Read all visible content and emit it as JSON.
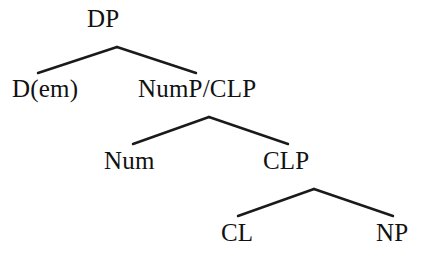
{
  "diagram": {
    "type": "syntax-tree",
    "background_color": "#ffffff",
    "line_color": "#1a1a1a",
    "text_color": "#111111",
    "nodes": [
      {
        "id": "dp",
        "label": "DP",
        "level": 0
      },
      {
        "id": "dem",
        "label": "D(em)",
        "level": 1
      },
      {
        "id": "nump_clp",
        "label": "NumP/CLP",
        "level": 1
      },
      {
        "id": "num",
        "label": "Num",
        "level": 2
      },
      {
        "id": "clp",
        "label": "CLP",
        "level": 2
      },
      {
        "id": "cl",
        "label": "CL",
        "level": 3
      },
      {
        "id": "np",
        "label": "NP",
        "level": 3
      }
    ],
    "edges": [
      {
        "from": "dp",
        "to": "dem"
      },
      {
        "from": "dp",
        "to": "nump_clp"
      },
      {
        "from": "nump_clp",
        "to": "num"
      },
      {
        "from": "nump_clp",
        "to": "clp"
      },
      {
        "from": "clp",
        "to": "cl"
      },
      {
        "from": "clp",
        "to": "np"
      }
    ],
    "branches": [
      {
        "id": "branch-dp",
        "apex_x": 117,
        "apex_y": 47,
        "left_x": 38,
        "left_y": 73,
        "right_x": 196,
        "right_y": 73
      },
      {
        "id": "branch-nump-clp",
        "apex_x": 209,
        "apex_y": 117,
        "left_x": 133,
        "left_y": 144,
        "right_x": 288,
        "right_y": 144
      },
      {
        "id": "branch-clp",
        "apex_x": 314,
        "apex_y": 189,
        "left_x": 238,
        "left_y": 216,
        "right_x": 393,
        "right_y": 216
      }
    ]
  }
}
